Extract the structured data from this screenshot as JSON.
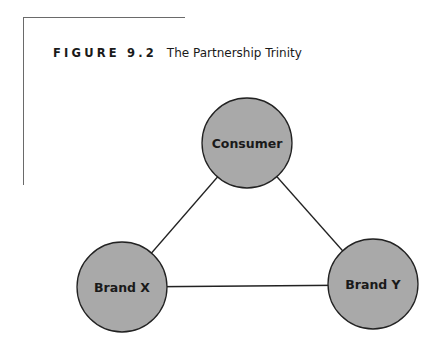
{
  "figure": {
    "label": "FIGURE 9.2",
    "title": "The Partnership Trinity"
  },
  "diagram": {
    "type": "triangle-network",
    "node_fill": "#a9a9a9",
    "node_stroke": "#222222",
    "edge_color": "#222222",
    "nodes": [
      {
        "id": "consumer",
        "label": "Consumer",
        "cx": 247,
        "cy": 143,
        "r": 45
      },
      {
        "id": "brand-x",
        "label": "Brand X",
        "cx": 122,
        "cy": 287,
        "r": 45
      },
      {
        "id": "brand-y",
        "label": "Brand Y",
        "cx": 373,
        "cy": 285,
        "r": 45
      }
    ],
    "edges": [
      {
        "from": "consumer",
        "to": "brand-x"
      },
      {
        "from": "consumer",
        "to": "brand-y"
      },
      {
        "from": "brand-x",
        "to": "brand-y"
      }
    ]
  }
}
